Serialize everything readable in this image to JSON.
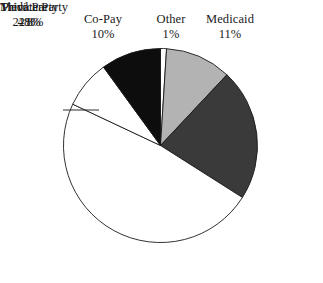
{
  "chart_data": {
    "type": "pie",
    "title": "",
    "subtitle": "",
    "xlabel": "",
    "ylabel": "",
    "legend_position": "none",
    "labels_outside": true,
    "start_angle_deg": 0,
    "direction": "clockwise",
    "categories": [
      "Other",
      "Medicaid",
      "Medicare",
      "Third Party",
      "Private Party",
      "Co-Pay"
    ],
    "values": [
      1,
      11,
      22,
      48,
      8,
      10
    ],
    "value_labels": [
      "1%",
      "11%",
      "22%",
      "48%",
      "8%",
      "10%"
    ],
    "colors": [
      "#ffffff",
      "#b3b3b3",
      "#3a3a3a",
      "#ffffff",
      "#ffffff",
      "#0d0d0d"
    ],
    "slice_outline_color": "#1a1a1a",
    "background_color": "#ffffff",
    "slices": [
      {
        "name": "Other",
        "value": 1,
        "pct_label": "1%",
        "color": "#ffffff"
      },
      {
        "name": "Medicaid",
        "value": 11,
        "pct_label": "11%",
        "color": "#b3b3b3"
      },
      {
        "name": "Medicare",
        "value": 22,
        "pct_label": "22%",
        "color": "#3a3a3a"
      },
      {
        "name": "Third Party",
        "value": 48,
        "pct_label": "48%",
        "color": "#ffffff"
      },
      {
        "name": "Private Party",
        "value": 8,
        "pct_label": "8%",
        "color": "#ffffff"
      },
      {
        "name": "Co-Pay",
        "value": 10,
        "pct_label": "10%",
        "color": "#0d0d0d"
      }
    ]
  },
  "labels": {
    "copay": {
      "name": "Co-Pay",
      "pct": "10%"
    },
    "other": {
      "name": "Other",
      "pct": "1%"
    },
    "medicaid": {
      "name": "Medicaid",
      "pct": "11%"
    },
    "private": {
      "name": "Private Party",
      "pct": "8%"
    },
    "medicare": {
      "name": "Medicare",
      "pct": "22%"
    },
    "third_party": {
      "name": "Third Party",
      "pct": "48%"
    }
  }
}
